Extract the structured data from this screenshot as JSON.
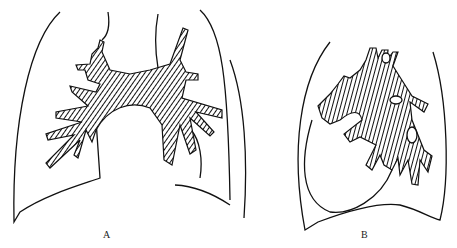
{
  "figure": {
    "panels": [
      {
        "id": "A",
        "label": "A",
        "description": "Chest outline with hatched bronchial/hilar tree spreading symmetrically above a rounded heart silhouette"
      },
      {
        "id": "B",
        "label": "B",
        "description": "Chest outline with compact hatched branching mass shifted to the right, with looping lower outline"
      }
    ],
    "colors": {
      "line": "#111111",
      "background": "#ffffff"
    }
  }
}
